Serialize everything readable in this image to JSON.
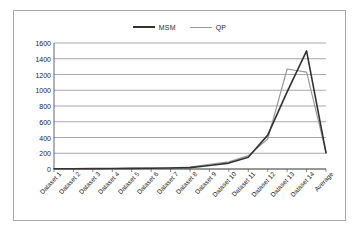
{
  "chart_data": {
    "type": "line",
    "title": "",
    "subtitle": "",
    "xlabel": "",
    "ylabel": "",
    "ylim": [
      0,
      1600
    ],
    "ytick_step": 200,
    "yticks": [
      1600,
      1400,
      1200,
      1000,
      800,
      600,
      400,
      200,
      0
    ],
    "grid": "horizontal",
    "legend_position": "top-center",
    "categories": [
      "Dataset 1",
      "Dataset 2",
      "Dataset 3",
      "Dataset 4",
      "Dataset 5",
      "Dataset 6",
      "Dataset 7",
      "Dataset 8",
      "Dataset 9",
      "Dataset 10",
      "Dataset 11",
      "Dataset 12",
      "Dataset 13",
      "Dataset 14",
      "Average"
    ],
    "series": [
      {
        "name": "MSM",
        "color": "#333333",
        "values": [
          3,
          4,
          5,
          6,
          8,
          10,
          12,
          18,
          45,
          75,
          150,
          430,
          980,
          1500,
          205
        ]
      },
      {
        "name": "QP",
        "color": "#9a9a9a",
        "values": [
          3,
          4,
          5,
          6,
          8,
          11,
          14,
          25,
          60,
          90,
          170,
          380,
          1270,
          1230,
          215
        ]
      }
    ]
  },
  "legend": {
    "entries": [
      {
        "label": "MSM",
        "color": "#333333"
      },
      {
        "label": "QP",
        "color": "#9a9a9a"
      }
    ]
  },
  "colors": {
    "frame_border": "#a8a8a8",
    "gridline": "#6f6f6f",
    "axis": "#404040",
    "background": "#ffffff",
    "series_msm": "#333333",
    "series_qp": "#9a9a9a"
  }
}
